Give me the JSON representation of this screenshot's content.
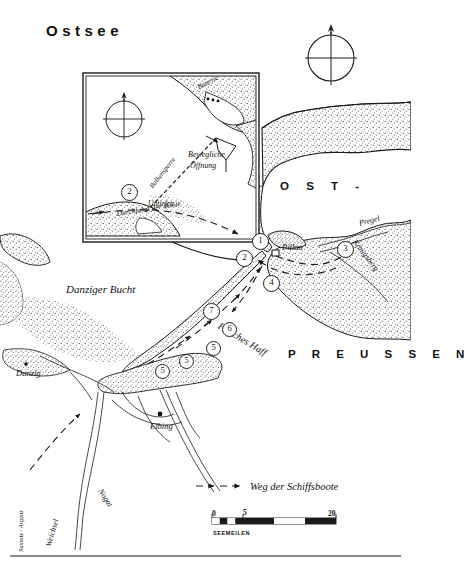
{
  "map": {
    "sea_title": "Ostsee",
    "region_west": "O S T -",
    "region_east": "P R E U S S E N",
    "bay_label": "Danziger Bucht",
    "lagoon_label": "Frisches Haff",
    "cities": [
      {
        "name": "Danzig",
        "id": "danzig"
      },
      {
        "name": "Elbing",
        "id": "elbing"
      },
      {
        "name": "Pillau",
        "id": "pillau"
      }
    ],
    "rivers": [
      {
        "name": "Pregel",
        "id": "pregel"
      },
      {
        "name": "Königsberg",
        "id": "koenigsberg"
      },
      {
        "name": "Weichsel",
        "id": "weichsel"
      },
      {
        "name": "Nogat",
        "id": "nogat"
      }
    ],
    "markers": [
      {
        "number": "1"
      },
      {
        "number": "2"
      },
      {
        "number": "3"
      },
      {
        "number": "4"
      },
      {
        "number": "5"
      },
      {
        "number": "5"
      },
      {
        "number": "5"
      },
      {
        "number": "6"
      },
      {
        "number": "7"
      }
    ],
    "compass": {
      "north_label": "N"
    },
    "credit": "Samuiz / Argenz"
  },
  "inset": {
    "compass": {
      "north_label": "N"
    },
    "labels": {
      "batterie": "Batterie",
      "balkensperre": "Balkensperre",
      "bewegliche_line1": "Bewegliche",
      "bewegliche_line2": "Öffnung",
      "untiefen": "Untiefen",
      "durchfahrt": "Durchfahrt der Boote"
    },
    "marker": {
      "number": "2"
    }
  },
  "legend": {
    "route_label": "Weg der Schiffsboote",
    "scale": {
      "ticks": [
        "0",
        "5",
        "20"
      ],
      "unit": "SEEMEILEN",
      "max": 20
    }
  },
  "colors": {
    "ink": "#1a1a1a",
    "paper": "#ffffff",
    "stipple": "#6a6a6a",
    "land_fill": "#f2f1ef"
  }
}
